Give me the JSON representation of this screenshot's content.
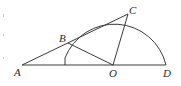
{
  "diagram": {
    "type": "geometry",
    "points": {
      "A": {
        "label": "A",
        "x": 22,
        "y": 65
      },
      "B": {
        "label": "B",
        "x": 68,
        "y": 43
      },
      "C": {
        "label": "C",
        "x": 128,
        "y": 14
      },
      "O": {
        "label": "O",
        "x": 113,
        "y": 65
      },
      "D": {
        "label": "D",
        "x": 166,
        "y": 65
      }
    },
    "circle": {
      "center": "O",
      "radius": 53,
      "arc": "upper semicircle from D to left endpoint on line AD"
    },
    "segments": [
      [
        "A",
        "D"
      ],
      [
        "A",
        "C"
      ],
      [
        "O",
        "B"
      ],
      [
        "O",
        "C"
      ]
    ],
    "labels": {
      "A": "A",
      "B": "B",
      "C": "C",
      "O": "O",
      "D": "D"
    }
  }
}
